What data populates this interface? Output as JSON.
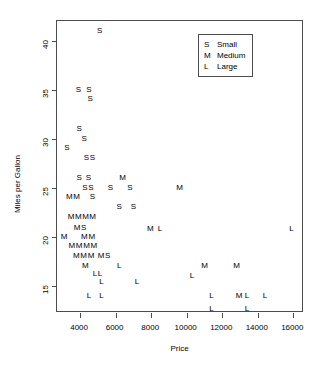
{
  "chart_data": {
    "type": "scatter",
    "title": "",
    "xlabel": "Price",
    "ylabel": "Miles per Gallon",
    "xlim": [
      2700,
      16600
    ],
    "ylim": [
      12.2,
      42.0
    ],
    "xticks": [
      4000,
      6000,
      8000,
      10000,
      12000,
      14000,
      16000
    ],
    "yticks": [
      15,
      20,
      25,
      30,
      35,
      40
    ],
    "grid": false,
    "legend_position": "top-right",
    "legend": [
      {
        "key": "S",
        "label": "Small"
      },
      {
        "key": "M",
        "label": "Medium"
      },
      {
        "key": "L",
        "label": "Large"
      }
    ],
    "point_marker": "letter-glyph",
    "series": [
      {
        "name": "Small",
        "key": "S",
        "points": [
          [
            5100,
            41.0
          ],
          [
            3900,
            35.0
          ],
          [
            4500,
            35.0
          ],
          [
            4550,
            34.0
          ],
          [
            3950,
            31.0
          ],
          [
            4200,
            30.0
          ],
          [
            3250,
            29.0
          ],
          [
            4450,
            28.0
          ],
          [
            4600,
            28.0
          ],
          [
            3950,
            26.0
          ],
          [
            4450,
            26.0
          ],
          [
            4350,
            25.0
          ],
          [
            4500,
            25.0
          ],
          [
            5700,
            25.0
          ],
          [
            6800,
            25.0
          ],
          [
            4700,
            24.0
          ],
          [
            6200,
            23.0
          ],
          [
            7000,
            23.0
          ],
          [
            4000,
            20.5
          ]
        ]
      },
      {
        "name": "Medium",
        "key": "M",
        "points": [
          [
            6400,
            26.0
          ],
          [
            9600,
            25.0
          ],
          [
            3400,
            24.0
          ],
          [
            3800,
            24.0
          ],
          [
            3600,
            22.0
          ],
          [
            3850,
            22.0
          ],
          [
            4150,
            22.0
          ],
          [
            4700,
            22.0
          ],
          [
            3100,
            20.0
          ],
          [
            4300,
            20.0
          ],
          [
            4600,
            20.0
          ],
          [
            3600,
            19.0
          ],
          [
            3800,
            19.0
          ],
          [
            4050,
            19.0
          ],
          [
            4350,
            19.0
          ],
          [
            4600,
            19.0
          ],
          [
            3900,
            18.0
          ],
          [
            4200,
            18.0
          ],
          [
            4450,
            18.0
          ],
          [
            5350,
            18.0
          ],
          [
            4300,
            17.0
          ],
          [
            7950,
            20.8
          ],
          [
            11000,
            17.0
          ],
          [
            12800,
            17.0
          ],
          [
            9700,
            17.0
          ],
          [
            12900,
            15.5
          ],
          [
            9800,
            16.0
          ]
        ]
      },
      {
        "name": "Large",
        "key": "L",
        "points": [
          [
            8500,
            20.8
          ],
          [
            15900,
            20.8
          ],
          [
            4900,
            16.2
          ],
          [
            6200,
            17.0
          ],
          [
            4750,
            15.5
          ],
          [
            5000,
            15.5
          ],
          [
            5200,
            14.8
          ],
          [
            7200,
            14.8
          ],
          [
            4500,
            13.8
          ],
          [
            5200,
            13.8
          ],
          [
            11400,
            13.8
          ],
          [
            13200,
            13.8
          ],
          [
            14300,
            13.8
          ],
          [
            10300,
            16.0
          ],
          [
            11400,
            12.6
          ],
          [
            13400,
            12.6
          ]
        ]
      }
    ],
    "rendered_glyphs": [
      {
        "t": "S",
        "x": 5100,
        "y": 41.0
      },
      {
        "t": "S",
        "x": 3900,
        "y": 35.0
      },
      {
        "t": "S",
        "x": 4500,
        "y": 35.0
      },
      {
        "t": "S",
        "x": 4560,
        "y": 34.0
      },
      {
        "t": "S",
        "x": 3950,
        "y": 31.0
      },
      {
        "t": "S",
        "x": 4230,
        "y": 30.0
      },
      {
        "t": "S",
        "x": 3250,
        "y": 29.0
      },
      {
        "t": "SS",
        "x": 4520,
        "y": 28.0
      },
      {
        "t": "S",
        "x": 3950,
        "y": 26.0
      },
      {
        "t": "S",
        "x": 4460,
        "y": 26.0
      },
      {
        "t": "M",
        "x": 6400,
        "y": 26.0
      },
      {
        "t": "SS",
        "x": 4440,
        "y": 25.0
      },
      {
        "t": "S",
        "x": 5700,
        "y": 25.0
      },
      {
        "t": "S",
        "x": 6800,
        "y": 25.0
      },
      {
        "t": "M",
        "x": 9600,
        "y": 25.0
      },
      {
        "t": "M",
        "x": 3400,
        "y": 24.0
      },
      {
        "t": "M",
        "x": 3800,
        "y": 24.0
      },
      {
        "t": "S",
        "x": 4700,
        "y": 24.0
      },
      {
        "t": "S",
        "x": 6200,
        "y": 23.0
      },
      {
        "t": "S",
        "x": 7000,
        "y": 23.0
      },
      {
        "t": "MMM",
        "x": 3900,
        "y": 22.0
      },
      {
        "t": "M",
        "x": 4700,
        "y": 22.0
      },
      {
        "t": "MS",
        "x": 4000,
        "y": 20.9
      },
      {
        "t": "M",
        "x": 3100,
        "y": 20.0
      },
      {
        "t": "MM",
        "x": 4450,
        "y": 20.0
      },
      {
        "t": "M",
        "x": 7950,
        "y": 20.8
      },
      {
        "t": "L",
        "x": 8500,
        "y": 20.8
      },
      {
        "t": "L",
        "x": 15900,
        "y": 20.8
      },
      {
        "t": "MMMM",
        "x": 4150,
        "y": 19.0
      },
      {
        "t": "MMM",
        "x": 4200,
        "y": 18.0
      },
      {
        "t": "MS",
        "x": 5350,
        "y": 18.0
      },
      {
        "t": "M",
        "x": 4300,
        "y": 17.0
      },
      {
        "t": "L",
        "x": 6200,
        "y": 17.0
      },
      {
        "t": "M",
        "x": 11000,
        "y": 17.0
      },
      {
        "t": "M",
        "x": 12800,
        "y": 17.0
      },
      {
        "t": "LL",
        "x": 4980,
        "y": 16.2
      },
      {
        "t": "L",
        "x": 10300,
        "y": 16.0
      },
      {
        "t": "L",
        "x": 5200,
        "y": 15.4
      },
      {
        "t": "L",
        "x": 7200,
        "y": 15.4
      },
      {
        "t": "L",
        "x": 4500,
        "y": 13.9
      },
      {
        "t": "L",
        "x": 5200,
        "y": 13.9
      },
      {
        "t": "L",
        "x": 11400,
        "y": 13.9
      },
      {
        "t": "M",
        "x": 12950,
        "y": 13.9
      },
      {
        "t": "L",
        "x": 13400,
        "y": 13.9
      },
      {
        "t": "L",
        "x": 14400,
        "y": 13.9
      },
      {
        "t": "L",
        "x": 11400,
        "y": 12.6
      },
      {
        "t": "L",
        "x": 13400,
        "y": 12.6
      }
    ]
  },
  "axes": {
    "x_title": "Price",
    "y_title": "Miles per Gallon",
    "x_ticklabels": [
      "4000",
      "6000",
      "8000",
      "10000",
      "12000",
      "14000",
      "16000"
    ],
    "y_ticklabels": [
      "15",
      "20",
      "25",
      "30",
      "35",
      "40"
    ]
  },
  "legend": {
    "rows": [
      {
        "key": "S",
        "label": "Small"
      },
      {
        "key": "M",
        "label": "Medium"
      },
      {
        "key": "L",
        "label": "Large"
      }
    ]
  },
  "colors": {
    "background": "#ffffff",
    "foreground": "#000000",
    "axis": "#4d4d4d"
  }
}
